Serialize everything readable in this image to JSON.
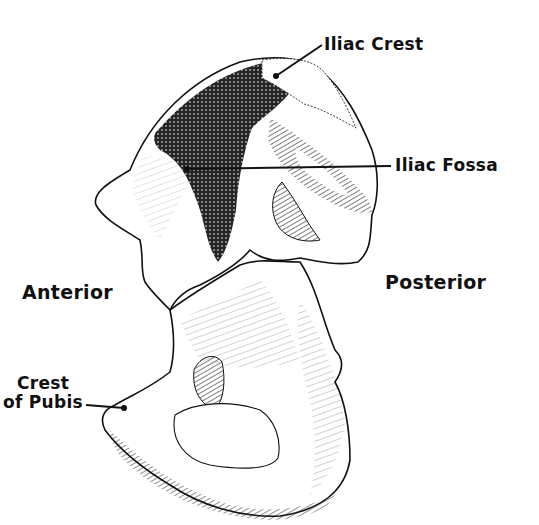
{
  "diagram": {
    "colors": {
      "ink": "#111111",
      "background": "#ffffff"
    },
    "labels": {
      "iliac_crest": "Iliac Crest",
      "iliac_fossa": "Iliac Fossa",
      "anterior": "Anterior",
      "posterior": "Posterior",
      "crest_of_pubis_line1": "Crest",
      "crest_of_pubis_line2": "of Pubis"
    },
    "leaders": [
      {
        "name": "iliac-crest",
        "from": [
          322,
          45
        ],
        "to": [
          276,
          76
        ]
      },
      {
        "name": "iliac-fossa",
        "from": [
          391,
          166
        ],
        "to": [
          187,
          169
        ]
      },
      {
        "name": "crest-of-pubis",
        "from": [
          86,
          405
        ],
        "to": [
          124,
          408
        ]
      }
    ]
  }
}
